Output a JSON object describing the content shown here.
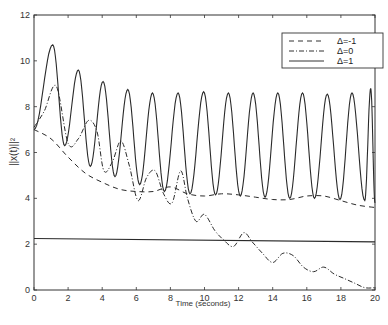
{
  "chart_data": {
    "type": "line",
    "title": "",
    "xlabel": "Time (seconds)",
    "ylabel": "||x(t)||²",
    "xlim": [
      0,
      20
    ],
    "ylim": [
      0,
      12
    ],
    "xticks": [
      0,
      2,
      4,
      6,
      8,
      10,
      12,
      14,
      16,
      18,
      20
    ],
    "yticks": [
      0,
      2,
      4,
      6,
      8,
      10,
      12
    ],
    "grid": false,
    "legend_position": "upper right",
    "series": [
      {
        "name": "Δ=-1",
        "style": "dashed",
        "x": [
          0,
          1,
          2,
          3,
          4,
          5,
          6,
          7,
          8,
          9,
          10,
          11,
          12,
          13,
          14,
          15,
          16,
          17,
          18,
          19,
          20
        ],
        "y": [
          7.0,
          6.6,
          5.8,
          5.1,
          4.7,
          4.4,
          4.3,
          4.3,
          4.5,
          4.2,
          4.1,
          4.2,
          4.15,
          4.05,
          3.95,
          3.95,
          4.1,
          4.1,
          3.9,
          3.7,
          3.6
        ]
      },
      {
        "name": "Δ=0",
        "style": "dash-dot",
        "x": [
          0,
          0.6,
          1.3,
          2.0,
          2.6,
          3.2,
          3.7,
          4.1,
          4.6,
          5.1,
          5.6,
          6.1,
          6.6,
          7.1,
          7.6,
          8.1,
          8.6,
          9.0,
          9.5,
          10.0,
          10.6,
          11.1,
          11.7,
          12.3,
          12.8,
          13.4,
          14.0,
          14.6,
          15.2,
          15.8,
          16.4,
          17.0,
          17.6,
          18.2,
          18.8,
          19.4,
          20.0
        ],
        "y": [
          7.1,
          7.8,
          8.9,
          6.4,
          6.6,
          7.4,
          6.9,
          5.2,
          5.6,
          6.5,
          5.4,
          3.9,
          4.9,
          5.2,
          4.2,
          3.8,
          5.2,
          4.0,
          3.0,
          3.3,
          2.6,
          2.2,
          1.9,
          2.5,
          2.1,
          1.6,
          1.2,
          1.6,
          1.5,
          1.0,
          0.8,
          1.0,
          0.7,
          0.5,
          0.3,
          0.1,
          0.1
        ]
      },
      {
        "name": "Δ=1",
        "style": "solid",
        "oscillation": {
          "period": 1.47,
          "peaks": [
            [
              1.1,
              10.7
            ],
            [
              2.6,
              9.6
            ],
            [
              4.05,
              9.1
            ],
            [
              5.5,
              8.75
            ],
            [
              6.95,
              8.6
            ],
            [
              8.45,
              8.6
            ],
            [
              9.95,
              8.65
            ],
            [
              11.4,
              8.6
            ],
            [
              12.85,
              8.6
            ],
            [
              14.3,
              8.6
            ],
            [
              15.75,
              8.6
            ],
            [
              17.2,
              8.55
            ],
            [
              18.65,
              8.6
            ],
            [
              19.75,
              8.8
            ]
          ],
          "troughs": [
            [
              1.8,
              6.3
            ],
            [
              3.3,
              5.4
            ],
            [
              4.75,
              4.95
            ],
            [
              6.2,
              4.6
            ],
            [
              7.65,
              4.3
            ],
            [
              9.15,
              4.2
            ],
            [
              10.65,
              4.15
            ],
            [
              12.1,
              4.1
            ],
            [
              13.55,
              4.05
            ],
            [
              15.0,
              4.0
            ],
            [
              16.45,
              4.0
            ],
            [
              17.95,
              3.95
            ],
            [
              19.4,
              3.9
            ]
          ]
        },
        "x": [
          0,
          1.1,
          1.8,
          2.6,
          3.3,
          4.05,
          4.75,
          5.5,
          6.2,
          6.95,
          7.65,
          8.45,
          9.15,
          9.95,
          10.65,
          11.4,
          12.1,
          12.85,
          13.55,
          14.3,
          15.0,
          15.75,
          16.45,
          17.2,
          17.95,
          18.65,
          19.4,
          19.75,
          20.0
        ],
        "y": [
          7.0,
          10.7,
          6.3,
          9.6,
          5.4,
          9.1,
          4.95,
          8.75,
          4.6,
          8.6,
          4.3,
          8.6,
          4.2,
          8.65,
          4.15,
          8.6,
          4.1,
          8.6,
          4.05,
          8.6,
          4.0,
          8.6,
          4.0,
          8.55,
          3.95,
          8.6,
          3.9,
          8.8,
          3.8
        ]
      },
      {
        "name": "Δ=1 bound",
        "style": "solid",
        "x": [
          0,
          20
        ],
        "y": [
          2.25,
          2.1
        ]
      }
    ],
    "legend": [
      "Δ=-1",
      "Δ=0",
      "Δ=1"
    ]
  }
}
